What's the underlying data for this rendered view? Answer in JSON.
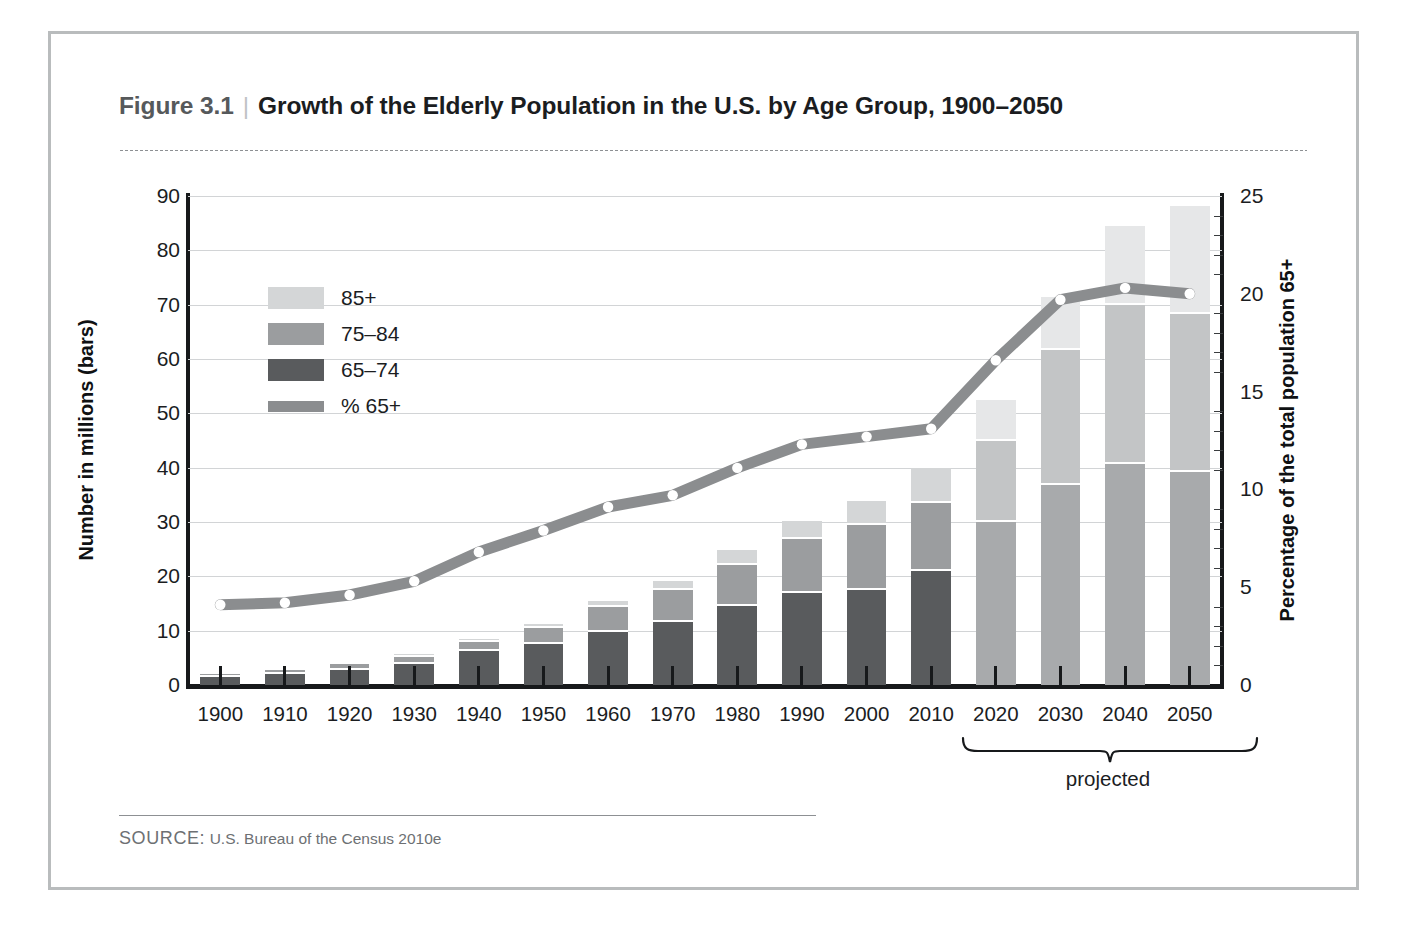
{
  "figure": {
    "number": "Figure 3.1",
    "separator": "|",
    "title": "Growth of the Elderly Population in the U.S. by Age Group, 1900–2050"
  },
  "source": {
    "label": "SOURCE:",
    "text": "U.S. Bureau of the Census 2010e"
  },
  "annotations": {
    "projected": "projected"
  },
  "colors": {
    "age_85_plus": "#d4d6d7",
    "age_75_84": "#9b9d9f",
    "age_65_74": "#595b5d",
    "line_65_plus": "#8b8d8f",
    "projected_85_plus": "#e6e7e8",
    "projected_75_84": "#c3c5c6",
    "projected_65_74": "#a8aaac",
    "axis": "#17191b",
    "gridline": "#d2d4d6",
    "frame": "#b9bcbd"
  },
  "chart_data": {
    "type": "bar",
    "title": "Growth of the Elderly Population in the U.S. by Age Group, 1900–2050",
    "xlabel": "",
    "ylabel": "Number in millions (bars)",
    "y2label": "Percentage of the total population 65+",
    "ylim": [
      0,
      90
    ],
    "yticks": [
      0,
      10,
      20,
      30,
      40,
      50,
      60,
      70,
      80,
      90
    ],
    "y2lim": [
      0,
      25
    ],
    "y2ticks": [
      0,
      5,
      10,
      15,
      20,
      25
    ],
    "grid": true,
    "legend_position": "upper-left",
    "categories": [
      "1900",
      "1910",
      "1920",
      "1930",
      "1940",
      "1950",
      "1960",
      "1970",
      "1980",
      "1990",
      "2000",
      "2010",
      "2020",
      "2030",
      "2040",
      "2050"
    ],
    "projected_categories": [
      "2020",
      "2030",
      "2040",
      "2050"
    ],
    "series": [
      {
        "name": "65–74",
        "type": "bar-segment",
        "values": [
          1.7,
          2.2,
          3.0,
          4.0,
          6.4,
          7.8,
          10.0,
          11.8,
          14.8,
          17.1,
          17.6,
          21.1,
          30.2,
          37.0,
          40.9,
          39.4
        ]
      },
      {
        "name": "75–84",
        "type": "bar-segment",
        "values": [
          0.6,
          0.8,
          1.0,
          1.4,
          1.7,
          2.8,
          4.6,
          5.9,
          7.4,
          9.9,
          12.0,
          12.6,
          14.9,
          24.9,
          29.3,
          29.0
        ]
      },
      {
        "name": "85+",
        "type": "bar-segment",
        "values": [
          0.1,
          0.2,
          0.2,
          0.3,
          0.4,
          0.6,
          0.9,
          1.4,
          2.7,
          3.1,
          4.2,
          6.3,
          7.3,
          9.6,
          14.2,
          19.7
        ]
      },
      {
        "name": "Total",
        "type": "bar-total",
        "values": [
          2.4,
          3.2,
          4.2,
          5.7,
          8.5,
          11.2,
          15.5,
          19.1,
          24.9,
          30.1,
          33.8,
          40.0,
          52.4,
          71.5,
          84.4,
          88.1
        ]
      },
      {
        "name": "% 65+",
        "type": "line",
        "axis": "right",
        "values": [
          4.1,
          4.2,
          4.6,
          5.3,
          6.8,
          7.9,
          9.1,
          9.7,
          11.1,
          12.3,
          12.7,
          13.1,
          16.6,
          19.7,
          20.3,
          20.0
        ]
      }
    ],
    "legend": [
      {
        "label": "85+",
        "swatch": "age_85_plus"
      },
      {
        "label": "75–84",
        "swatch": "age_75_84"
      },
      {
        "label": "65–74",
        "swatch": "age_65_74"
      },
      {
        "label": "% 65+",
        "swatch": "line_65_plus"
      }
    ]
  }
}
